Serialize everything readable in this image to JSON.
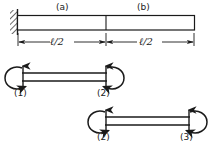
{
  "figure": {
    "type": "structural-beam-diagram",
    "stroke_color": "#1a1a1a",
    "background_color": "#ffffff"
  },
  "beam": {
    "segment_labels": [
      {
        "id": "segment-a",
        "text": "(a)",
        "x": 63,
        "y": 4
      },
      {
        "id": "segment-b",
        "text": "(b)",
        "x": 143,
        "y": 4
      }
    ],
    "support": {
      "type": "fixed-hatched-wall",
      "side": "left"
    },
    "free_end": {
      "side": "right"
    }
  },
  "dimensions": [
    {
      "id": "dim-left",
      "text": "ℓ/2",
      "x": 52,
      "y": 38
    },
    {
      "id": "dim-right",
      "text": "ℓ/2",
      "x": 140,
      "y": 38
    }
  ],
  "members": [
    {
      "id": "member-1-2",
      "start_node": {
        "label": "(1)",
        "x": 16,
        "y": 90,
        "moment": "counterclockwise-arc-left",
        "shear": "up-arrow"
      },
      "end_node": {
        "label": "(2)",
        "x": 98,
        "y": 90,
        "moment": "clockwise-arc-right",
        "shear": "up-arrow"
      }
    },
    {
      "id": "member-2-3",
      "start_node": {
        "label": "(2)",
        "x": 99,
        "y": 134,
        "moment": "counterclockwise-arc-left",
        "shear": "up-arrow"
      },
      "end_node": {
        "label": "(3)",
        "x": 181,
        "y": 134,
        "moment": "clockwise-arc-right",
        "shear": "up-arrow"
      }
    }
  ]
}
